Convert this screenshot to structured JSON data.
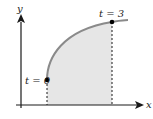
{
  "diagram": {
    "axes": {
      "x_label": "x",
      "y_label": "y"
    },
    "points": [
      {
        "label": "t = 0",
        "x": 47,
        "y": 80
      },
      {
        "label": "t = 3",
        "x": 112,
        "y": 22
      }
    ],
    "colors": {
      "curve": "#8a8a8a",
      "fill": "#e6e6e6",
      "axis": "#1a1a1a",
      "dashed": "#1a1a1a",
      "point": "#000000"
    }
  }
}
